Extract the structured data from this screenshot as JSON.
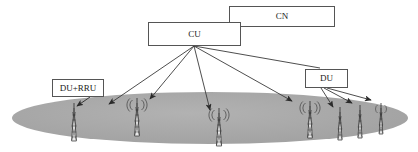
{
  "diagram": {
    "type": "network-architecture-diagram",
    "background_color": "#ffffff",
    "coverage_area": {
      "name": "coverage-ellipse",
      "shape": "ellipse",
      "fill_color": "#a8a8a8",
      "center_x": 210,
      "center_y": 118,
      "radius_x": 198,
      "radius_y": 26
    },
    "nodes": [
      {
        "id": "cu",
        "label": "CU",
        "x": 148,
        "y": 22,
        "width": 93,
        "height": 24
      },
      {
        "id": "cn",
        "label": "CN",
        "x": 229,
        "y": 6,
        "width": 106,
        "height": 21
      },
      {
        "id": "durru",
        "label": "DU+RRU",
        "x": 52,
        "y": 79,
        "width": 52,
        "height": 18
      },
      {
        "id": "du",
        "label": "DU",
        "x": 305,
        "y": 69,
        "width": 43,
        "height": 19
      }
    ],
    "line_color": "#3a3a3a",
    "fan_origin": {
      "x": 194,
      "y": 46
    },
    "cu_links": [
      {
        "to": "tower-1",
        "x2": 109,
        "y2": 104
      },
      {
        "to": "tower-2",
        "x2": 150,
        "y2": 99
      },
      {
        "to": "tower-3",
        "x2": 210,
        "y2": 110
      },
      {
        "to": "tower-4",
        "x2": 292,
        "y2": 101
      },
      {
        "to": "du",
        "x2": 322,
        "y2": 69
      }
    ],
    "du_links": [
      {
        "to": "tower-5",
        "x2": 333,
        "y2": 107
      },
      {
        "to": "tower-6",
        "x2": 352,
        "y2": 103
      },
      {
        "to": "tower-7",
        "x2": 371,
        "y2": 100
      }
    ],
    "durru_link": {
      "x1": 88,
      "y1": 97,
      "x2": 78,
      "y2": 105
    },
    "towers": [
      {
        "id": "tower-1",
        "x": 74,
        "y": 108,
        "height": 33,
        "signal": false
      },
      {
        "id": "tower-2",
        "x": 137,
        "y": 103,
        "height": 33,
        "signal": true
      },
      {
        "id": "tower-3",
        "x": 219,
        "y": 113,
        "height": 33,
        "signal": true
      },
      {
        "id": "tower-4",
        "x": 310,
        "y": 106,
        "height": 32,
        "signal": true
      },
      {
        "id": "tower-5",
        "x": 340,
        "y": 112,
        "height": 28,
        "signal": false
      },
      {
        "id": "tower-6",
        "x": 360,
        "y": 110,
        "height": 28,
        "signal": false
      },
      {
        "id": "tower-7",
        "x": 381,
        "y": 108,
        "height": 26,
        "signal": false
      }
    ]
  }
}
